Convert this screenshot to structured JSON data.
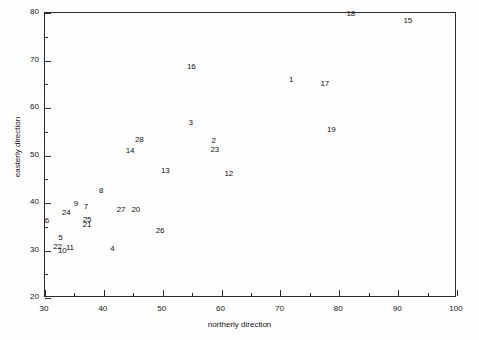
{
  "chart_data": {
    "type": "scatter",
    "title": "",
    "xlabel": "northerly direction",
    "ylabel": "easterly direction",
    "xlim": [
      30,
      100
    ],
    "ylim": [
      20,
      80
    ],
    "xticks": [
      30,
      40,
      50,
      60,
      70,
      80,
      90,
      100
    ],
    "yticks": [
      20,
      30,
      40,
      50,
      60,
      70,
      80
    ],
    "xticklabels": [
      "30",
      "40",
      "50",
      "60",
      "70",
      "80",
      "90",
      "100"
    ],
    "yticklabels": [
      "20",
      "30",
      "40",
      "50",
      "60",
      "70",
      "80"
    ],
    "xminorticks": [
      35,
      45,
      55,
      65,
      75,
      85,
      95
    ],
    "yminorticks": [
      25,
      35,
      45,
      55,
      65,
      75
    ],
    "grid": false,
    "legend": null,
    "marker_style": "text-label",
    "points": [
      {
        "label": "1",
        "x": 72.0,
        "y": 65.6
      },
      {
        "label": "2",
        "x": 58.8,
        "y": 52.9
      },
      {
        "label": "3",
        "x": 54.9,
        "y": 56.7
      },
      {
        "label": "4",
        "x": 41.6,
        "y": 30.1
      },
      {
        "label": "5",
        "x": 32.8,
        "y": 32.5
      },
      {
        "label": "6",
        "x": 30.5,
        "y": 36.0
      },
      {
        "label": "7",
        "x": 37.1,
        "y": 38.9
      },
      {
        "label": "8",
        "x": 39.7,
        "y": 42.3
      },
      {
        "label": "9",
        "x": 35.4,
        "y": 39.6
      },
      {
        "label": "10",
        "x": 33.1,
        "y": 29.7
      },
      {
        "label": "11",
        "x": 34.4,
        "y": 30.4
      },
      {
        "label": "12",
        "x": 61.4,
        "y": 46.0
      },
      {
        "label": "13",
        "x": 50.6,
        "y": 46.6
      },
      {
        "label": "14",
        "x": 44.6,
        "y": 50.8
      },
      {
        "label": "15",
        "x": 91.8,
        "y": 78.1
      },
      {
        "label": "16",
        "x": 55.0,
        "y": 68.5
      },
      {
        "label": "17",
        "x": 77.7,
        "y": 64.9
      },
      {
        "label": "18",
        "x": 82.1,
        "y": 79.5
      },
      {
        "label": "19",
        "x": 78.8,
        "y": 55.1
      },
      {
        "label": "20",
        "x": 45.6,
        "y": 38.4
      },
      {
        "label": "21",
        "x": 37.3,
        "y": 35.2
      },
      {
        "label": "22",
        "x": 32.3,
        "y": 30.5
      },
      {
        "label": "23",
        "x": 59.0,
        "y": 51.0
      },
      {
        "label": "24",
        "x": 33.8,
        "y": 37.6
      },
      {
        "label": "25",
        "x": 37.3,
        "y": 36.2
      },
      {
        "label": "26",
        "x": 49.7,
        "y": 34.0
      },
      {
        "label": "27",
        "x": 43.1,
        "y": 38.4
      },
      {
        "label": "28",
        "x": 46.2,
        "y": 53.0
      }
    ]
  },
  "axes": {
    "x_label": "northerly direction",
    "y_label": "easterly direction"
  }
}
